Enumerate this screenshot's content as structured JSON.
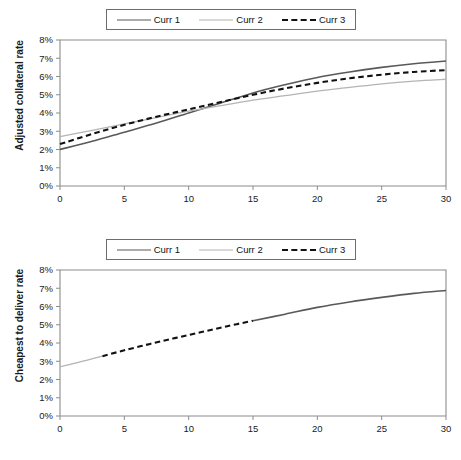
{
  "figure": {
    "title": "",
    "panels": [
      "adjusted-collateral-rate",
      "cheapest-to-deliver-rate"
    ]
  },
  "legend": {
    "position": "above-plot",
    "entries": [
      {
        "label": "Curr 1",
        "style": "solid",
        "color": "#595959",
        "swatch": "sw-solid-dark"
      },
      {
        "label": "Curr 2",
        "style": "solid",
        "color": "#b4b4b4",
        "swatch": "sw-solid-light"
      },
      {
        "label": "Curr 3",
        "style": "dashed",
        "color": "#111111",
        "swatch": "sw-dashed"
      }
    ]
  },
  "axes": {
    "x_label": "Time (years)",
    "x_ticks": [
      "0",
      "5",
      "10",
      "15",
      "20",
      "25",
      "30"
    ],
    "y_ticks": [
      "0%",
      "1%",
      "2%",
      "3%",
      "4%",
      "5%",
      "6%",
      "7%",
      "8%"
    ],
    "y_label_top": "Adjusted collateral rate",
    "y_label_bottom": "Cheapest to deliver rate"
  },
  "chart_data": [
    {
      "type": "line",
      "title": "Adjusted collateral rate",
      "xlabel": "Time (years)",
      "ylabel": "Adjusted collateral rate",
      "xlim": [
        0,
        30
      ],
      "ylim": [
        0,
        8
      ],
      "xticks": [
        0,
        5,
        10,
        15,
        20,
        25,
        30
      ],
      "yticks": [
        0,
        1,
        2,
        3,
        4,
        5,
        6,
        7,
        8
      ],
      "ytick_format": "percent",
      "grid": false,
      "legend_position": "top-center",
      "x": [
        0,
        2.5,
        5,
        7.5,
        10,
        12.5,
        15,
        17.5,
        20,
        22.5,
        25,
        27.5,
        30
      ],
      "series": [
        {
          "name": "Curr 1",
          "style": "solid",
          "color": "#595959",
          "values": [
            2.0,
            2.45,
            2.95,
            3.45,
            4.0,
            4.55,
            5.1,
            5.55,
            5.95,
            6.25,
            6.5,
            6.7,
            6.85
          ]
        },
        {
          "name": "Curr 2",
          "style": "solid",
          "color": "#b4b4b4",
          "values": [
            2.7,
            3.05,
            3.4,
            3.75,
            4.1,
            4.4,
            4.7,
            4.95,
            5.2,
            5.4,
            5.6,
            5.75,
            5.85
          ]
        },
        {
          "name": "Curr 3",
          "style": "dashed",
          "color": "#111111",
          "values": [
            2.3,
            2.85,
            3.35,
            3.8,
            4.2,
            4.6,
            5.0,
            5.35,
            5.65,
            5.9,
            6.1,
            6.25,
            6.35
          ]
        }
      ]
    },
    {
      "type": "line",
      "title": "Cheapest to deliver rate",
      "xlabel": "Time (years)",
      "ylabel": "Cheapest to deliver rate",
      "xlim": [
        0,
        30
      ],
      "ylim": [
        0,
        8
      ],
      "xticks": [
        0,
        5,
        10,
        15,
        20,
        25,
        30
      ],
      "yticks": [
        0,
        1,
        2,
        3,
        4,
        5,
        6,
        7,
        8
      ],
      "ytick_format": "percent",
      "grid": false,
      "legend_position": "top-center",
      "description": "Minimum-of-three envelope; the cheapest currency switches along the curve",
      "segments": [
        {
          "name": "Curr 2",
          "style": "solid",
          "color": "#b4b4b4",
          "x": [
            0,
            1.1,
            2.2,
            3.3
          ],
          "values": [
            2.7,
            2.88,
            3.08,
            3.28
          ]
        },
        {
          "name": "Curr 3",
          "style": "dashed",
          "color": "#111111",
          "x": [
            3.3,
            5,
            7,
            9,
            11,
            13,
            15
          ],
          "values": [
            3.28,
            3.6,
            3.95,
            4.28,
            4.6,
            4.92,
            5.22
          ]
        },
        {
          "name": "Curr 1",
          "style": "solid",
          "color": "#595959",
          "x": [
            15,
            17.5,
            20,
            22.5,
            25,
            27.5,
            30
          ],
          "values": [
            5.22,
            5.58,
            5.95,
            6.25,
            6.5,
            6.72,
            6.88
          ]
        }
      ]
    }
  ]
}
